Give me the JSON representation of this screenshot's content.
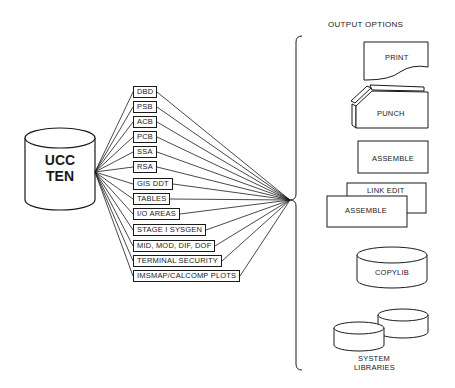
{
  "source": {
    "label_line1": "UCC",
    "label_line2": "TEN"
  },
  "inputs": [
    {
      "label": "DBD",
      "x": 133,
      "y": 86
    },
    {
      "label": "PSB",
      "x": 133,
      "y": 101
    },
    {
      "label": "ACB",
      "x": 133,
      "y": 116
    },
    {
      "label": "PCB",
      "x": 133,
      "y": 131
    },
    {
      "label": "SSA",
      "x": 133,
      "y": 146
    },
    {
      "label": "RSA",
      "x": 133,
      "y": 161
    },
    {
      "label": "GIS DDT",
      "x": 133,
      "y": 178
    },
    {
      "label": "TABLES",
      "x": 133,
      "y": 193
    },
    {
      "label": "I/O AREAS",
      "x": 133,
      "y": 208
    },
    {
      "label": "STAGE I SYSGEN",
      "x": 133,
      "y": 224
    },
    {
      "label": "MID, MOD, DIF, DOF",
      "x": 133,
      "y": 240
    },
    {
      "label": "TERMINAL SECURITY",
      "x": 133,
      "y": 255
    },
    {
      "label": "IMSMAP/CALCOMP PLOTS",
      "x": 133,
      "y": 270
    }
  ],
  "output_options": {
    "title": "OUTPUT OPTIONS",
    "print": "PRINT",
    "punch": "PUNCH",
    "assemble": "ASSEMBLE",
    "link_edit": "LINK EDIT",
    "assemble2": "ASSEMBLE",
    "copylib": "COPYLIB",
    "system_libraries_line1": "SYSTEM",
    "system_libraries_line2": "LIBRARIES"
  }
}
